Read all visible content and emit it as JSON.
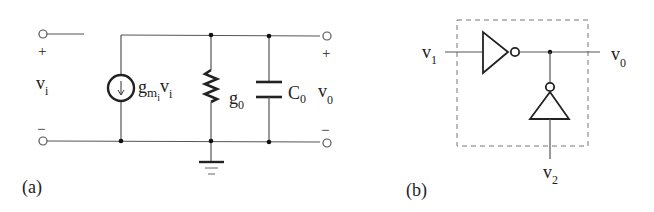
{
  "figure_a": {
    "label": "(a)",
    "input_voltage": {
      "base": "v",
      "sub": "i"
    },
    "input_plus": "+",
    "input_minus": "−",
    "current_source": {
      "g": "g",
      "sub_m": "m",
      "sub_i": "i",
      "v": "v",
      "v_sub": "i"
    },
    "conductance": {
      "base": "g",
      "sub": "0"
    },
    "capacitor": {
      "base": "C",
      "sub": "0"
    },
    "output_voltage": {
      "base": "v",
      "sub": "0"
    },
    "output_plus": "+",
    "output_minus": "−"
  },
  "figure_b": {
    "label": "(b)",
    "input1": {
      "base": "v",
      "sub": "1"
    },
    "input2": {
      "base": "v",
      "sub": "2"
    },
    "output": {
      "base": "v",
      "sub": "0"
    }
  }
}
